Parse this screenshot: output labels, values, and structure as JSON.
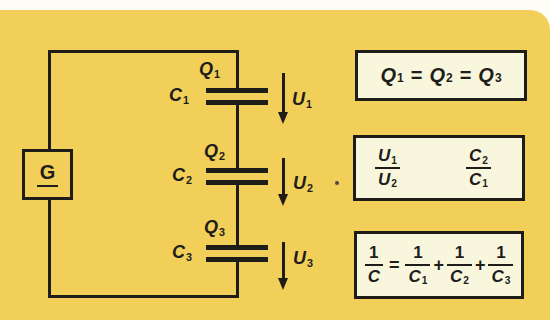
{
  "colors": {
    "page_bg": "#fdfdf6",
    "card_bg": "#f1cf58",
    "panel_bg": "#f9f6de",
    "ink": "#1e1d1a"
  },
  "circuit": {
    "generator_label": "G",
    "branches": [
      {
        "charge_var": "Q",
        "charge_sub": "1",
        "cap_var": "C",
        "cap_sub": "1",
        "volt_var": "U",
        "volt_sub": "1"
      },
      {
        "charge_var": "Q",
        "charge_sub": "2",
        "cap_var": "C",
        "cap_sub": "2",
        "volt_var": "U",
        "volt_sub": "2"
      },
      {
        "charge_var": "Q",
        "charge_sub": "3",
        "cap_var": "C",
        "cap_sub": "3",
        "volt_var": "U",
        "volt_sub": "3"
      }
    ]
  },
  "formulas": {
    "charges": {
      "t1_var": "Q",
      "t1_sub": "1",
      "op1": "=",
      "t2_var": "Q",
      "t2_sub": "2",
      "op2": "=",
      "t3_var": "Q",
      "t3_sub": "3"
    },
    "ratio": {
      "left_num_var": "U",
      "left_num_sub": "1",
      "left_den_var": "U",
      "left_den_sub": "2",
      "right_num_var": "C",
      "right_num_sub": "2",
      "right_den_var": "C",
      "right_den_sub": "1"
    },
    "reciprocal": {
      "lhs_num": "1",
      "lhs_den_var": "C",
      "eq": "=",
      "t1_num": "1",
      "t1_den_var": "C",
      "t1_den_sub": "1",
      "plus1": "+",
      "t2_num": "1",
      "t2_den_var": "C",
      "t2_den_sub": "2",
      "plus2": "+",
      "t3_num": "1",
      "t3_den_var": "C",
      "t3_den_sub": "3"
    }
  }
}
